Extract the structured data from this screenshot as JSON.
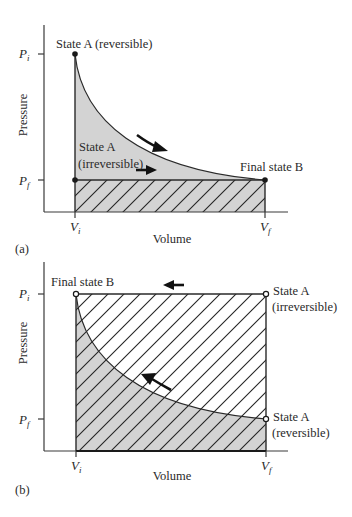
{
  "figure": {
    "panel_a": {
      "tag": "(a)",
      "ylabel": "Pressure",
      "xlabel": "Volume",
      "y_ticks": [
        {
          "main": "P",
          "sub": "i"
        },
        {
          "main": "P",
          "sub": "f"
        }
      ],
      "x_ticks": [
        {
          "main": "V",
          "sub": "i"
        },
        {
          "main": "V",
          "sub": "f"
        }
      ],
      "labels": {
        "start_reversible": "State A (reversible)",
        "start_irreversible_line1": "State A",
        "start_irreversible_line2": "(irreversible)",
        "end": "Final state B"
      },
      "process": "expansion",
      "marker_style": "filled-dot"
    },
    "panel_b": {
      "tag": "(b)",
      "ylabel": "Pressure",
      "xlabel": "Volume",
      "y_ticks": [
        {
          "main": "P",
          "sub": "i"
        },
        {
          "main": "P",
          "sub": "f"
        }
      ],
      "x_ticks": [
        {
          "main": "V",
          "sub": "i"
        },
        {
          "main": "V",
          "sub": "f"
        }
      ],
      "labels": {
        "end": "Final state B",
        "start_irreversible_line1": "State A",
        "start_irreversible_line2": "(irreversible)",
        "start_reversible_line1": "State A",
        "start_reversible_line2": "(reversible)"
      },
      "process": "compression",
      "marker_style": "open-circle"
    },
    "colors": {
      "reversible_work_fill": "#d3d3d3",
      "line": "#2a2a2a",
      "background": "#ffffff"
    }
  }
}
